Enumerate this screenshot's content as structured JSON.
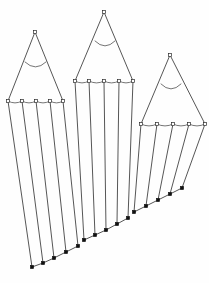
{
  "figure": {
    "type": "line-diagram",
    "canvas": {
      "width": 209,
      "height": 283
    },
    "background_color": "#fefefe",
    "line_color": "#2b2b2b",
    "open_marker_fill": "#ffffff",
    "solid_marker_fill": "#111111",
    "marker_size": 3.2,
    "groups": [
      {
        "name": "left-peak",
        "apex": {
          "x": 35,
          "y": 32
        },
        "apex_marker": "open-square",
        "inner_arc": {
          "x1": 25,
          "y1": 62,
          "x2": 46,
          "y2": 62,
          "sag": 5
        },
        "base_y_left": 101,
        "base_y_right": 101,
        "base_x_left": 8,
        "base_x_right": 63,
        "base_points": [
          {
            "x": 8,
            "y": 101
          },
          {
            "x": 22,
            "y": 101
          },
          {
            "x": 36,
            "y": 101
          },
          {
            "x": 50,
            "y": 101
          },
          {
            "x": 63,
            "y": 101
          }
        ],
        "bottom_points": [
          {
            "x": 32,
            "y": 267
          },
          {
            "x": 43,
            "y": 263
          },
          {
            "x": 54,
            "y": 258
          },
          {
            "x": 66,
            "y": 252
          },
          {
            "x": 78,
            "y": 246
          }
        ]
      },
      {
        "name": "middle-peak",
        "apex": {
          "x": 104,
          "y": 12
        },
        "apex_marker": "open-square",
        "inner_arc": {
          "x1": 95,
          "y1": 41,
          "x2": 115,
          "y2": 41,
          "sag": 5
        },
        "base_y_left": 81,
        "base_y_right": 81,
        "base_x_left": 75,
        "base_x_right": 133,
        "base_points": [
          {
            "x": 75,
            "y": 81
          },
          {
            "x": 89,
            "y": 81
          },
          {
            "x": 104,
            "y": 81
          },
          {
            "x": 119,
            "y": 81
          },
          {
            "x": 133,
            "y": 81
          }
        ],
        "bottom_points": [
          {
            "x": 84,
            "y": 240
          },
          {
            "x": 95,
            "y": 235
          },
          {
            "x": 106,
            "y": 230
          },
          {
            "x": 117,
            "y": 224
          },
          {
            "x": 128,
            "y": 218
          }
        ]
      },
      {
        "name": "right-peak",
        "apex": {
          "x": 170,
          "y": 55
        },
        "apex_marker": "open-square",
        "inner_arc": {
          "x1": 161,
          "y1": 84,
          "x2": 181,
          "y2": 84,
          "sag": 5
        },
        "base_y_left": 124,
        "base_y_right": 124,
        "base_x_left": 141,
        "base_x_right": 205,
        "base_points": [
          {
            "x": 141,
            "y": 124
          },
          {
            "x": 157,
            "y": 124
          },
          {
            "x": 173,
            "y": 124
          },
          {
            "x": 189,
            "y": 124
          },
          {
            "x": 205,
            "y": 124
          }
        ],
        "bottom_points": [
          {
            "x": 134,
            "y": 212
          },
          {
            "x": 146,
            "y": 206
          },
          {
            "x": 158,
            "y": 200
          },
          {
            "x": 170,
            "y": 194
          },
          {
            "x": 182,
            "y": 188
          }
        ]
      }
    ],
    "labels": []
  }
}
